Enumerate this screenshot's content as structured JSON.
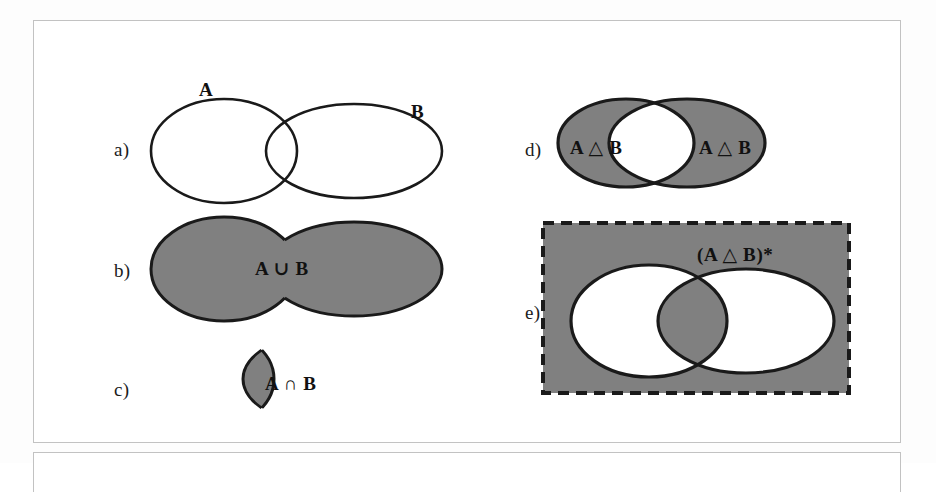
{
  "figure": {
    "colors": {
      "fill_gray": "#808080",
      "outline": "#1a1a1a",
      "frame_border": "#c2c2c2",
      "background": "#ffffff"
    }
  },
  "panels": [
    {
      "id": "a",
      "label": "a)",
      "caption": "Two overlapping sets A and B, outlines only",
      "labels": [
        "A",
        "B"
      ]
    },
    {
      "id": "b",
      "label": "b)",
      "caption": "Union of A and B, entire blob shaded",
      "labels": [
        "A ∪ B"
      ]
    },
    {
      "id": "c",
      "label": "c)",
      "caption": "Intersection of A and B, lens shaded",
      "labels": [
        "A ∩ B"
      ]
    },
    {
      "id": "d",
      "label": "d)",
      "caption": "Symmetric difference of A and B, both ellipses shaded except intersection",
      "labels": [
        "A △ B",
        "A △ B"
      ]
    },
    {
      "id": "e",
      "label": "e)",
      "caption": "Complement of the symmetric difference, universe rectangle shaded except the exclusive parts",
      "labels": [
        "(A △ B)*"
      ]
    }
  ],
  "set_labels": {
    "a_label": "A",
    "b_label": "B",
    "union": "A ∪ B",
    "intersection": "A ∩ B",
    "symmetric_difference_left": "A △ B",
    "symmetric_difference_right": "A △ B",
    "symmetric_difference_complement": "(A △ B)*"
  }
}
